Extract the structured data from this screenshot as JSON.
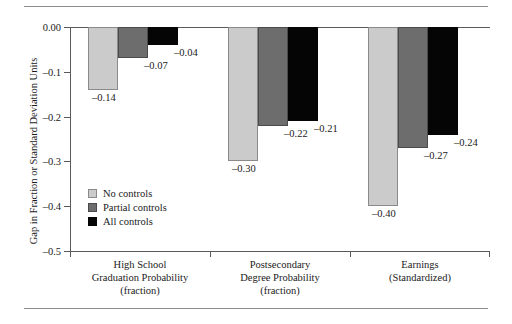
{
  "chart_data": {
    "type": "bar",
    "title": "",
    "xlabel": "",
    "ylabel": "Gap in Fraction or Standard Deviation Units",
    "ylim": [
      -0.5,
      0.0
    ],
    "yticks": [
      0.0,
      -0.1,
      -0.2,
      -0.3,
      -0.4,
      -0.5
    ],
    "ytick_labels": [
      "0.00",
      "–0.1",
      "–0.2",
      "–0.3",
      "–0.4",
      "–0.5"
    ],
    "grid": false,
    "legend_position": "inside-lower-left",
    "categories": [
      "High School Graduation Probability (fraction)",
      "Postsecondary Degree Probability (fraction)",
      "Earnings (Standardized)"
    ],
    "category_lines": [
      [
        "High School",
        "Graduation Probability",
        "(fraction)"
      ],
      [
        "Postsecondary",
        "Degree Probability",
        "(fraction)"
      ],
      [
        "Earnings",
        "(Standardized)"
      ]
    ],
    "series": [
      {
        "name": "No controls",
        "color": "#cbcbcb",
        "values": [
          -0.14,
          -0.3,
          -0.4
        ],
        "value_labels": [
          "–0.14",
          "–0.30",
          "–0.40"
        ]
      },
      {
        "name": "Partial controls",
        "color": "#6d6d6d",
        "values": [
          -0.07,
          -0.22,
          -0.27
        ],
        "value_labels": [
          "–0.07",
          "–0.22",
          "–0.27"
        ]
      },
      {
        "name": "All controls",
        "color": "#050505",
        "values": [
          -0.04,
          -0.21,
          -0.24
        ],
        "value_labels": [
          "–0.04",
          "–0.21",
          "–0.24"
        ]
      }
    ]
  },
  "legend": {
    "items": [
      {
        "label": "No controls",
        "color": "#cbcbcb"
      },
      {
        "label": "Partial controls",
        "color": "#6d6d6d"
      },
      {
        "label": "All controls",
        "color": "#050505"
      }
    ]
  },
  "caption": ""
}
